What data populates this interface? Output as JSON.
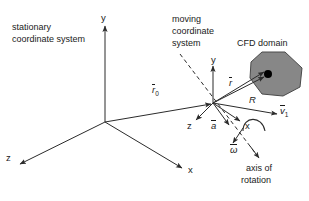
{
  "figure": {
    "background": "#ffffff",
    "stroke_color": "#2b2b2b",
    "domain_fill": "#878787",
    "domain_stroke": "#4a4a4a",
    "point_color": "#000000",
    "width": 309,
    "height": 201
  },
  "captions": {
    "stationary_line1": "stationary",
    "stationary_line2": "coordinate system",
    "moving_line1": "moving",
    "moving_line2": "coordinate",
    "moving_line3": "system",
    "cfd_domain": "CFD domain",
    "axis_of_rotation_line1": "axis of",
    "axis_of_rotation_line2": "rotation"
  },
  "stationary_frame": {
    "origin": [
      105,
      122
    ],
    "axes": [
      {
        "name": "y-axis",
        "label": "y",
        "label_pos": [
          101,
          14
        ],
        "tip": [
          105,
          26
        ]
      },
      {
        "name": "x-axis",
        "label": "x",
        "label_pos": [
          188,
          166
        ],
        "tip": [
          182,
          168
        ]
      },
      {
        "name": "z-axis",
        "label": "z",
        "label_pos": [
          7,
          156
        ],
        "tip": [
          20,
          164
        ]
      }
    ]
  },
  "moving_frame": {
    "origin": [
      213,
      103
    ],
    "axes": [
      {
        "name": "y-axis",
        "label": "y",
        "label_pos": [
          211,
          55
        ],
        "tip": [
          213,
          66
        ]
      },
      {
        "name": "x-axis",
        "label": "x",
        "label_pos": [
          246,
          123
        ],
        "tip": [
          240,
          121
        ]
      },
      {
        "name": "z-axis",
        "label": "z",
        "label_pos": [
          188,
          123
        ],
        "tip": [
          196,
          120
        ]
      }
    ]
  },
  "vectors": [
    {
      "name": "r0-vector",
      "label": "r",
      "subscript": "0",
      "label_pos": [
        152,
        85
      ],
      "from": [
        105,
        122
      ],
      "to": [
        213,
        103
      ]
    },
    {
      "name": "r-vector",
      "label": "r",
      "subscript": "",
      "label_pos": [
        229,
        78
      ],
      "from": [
        213,
        103
      ],
      "to": [
        265,
        73
      ]
    },
    {
      "name": "R-vector",
      "label": "R",
      "subscript": "",
      "label_pos": [
        249,
        95
      ],
      "overbar": false,
      "from": [
        213,
        103
      ],
      "to": [
        266,
        76
      ]
    },
    {
      "name": "a-vector",
      "label": "a",
      "subscript": "",
      "label_pos": [
        212,
        121
      ],
      "from": [
        213,
        103
      ],
      "to": [
        229,
        125
      ]
    },
    {
      "name": "v1-vector",
      "label": "v",
      "subscript": "1",
      "label_pos": [
        281,
        106
      ],
      "from": [
        213,
        103
      ],
      "to": [
        277,
        114
      ]
    },
    {
      "name": "omega-vector",
      "label": "ω",
      "subscript": "",
      "label_pos": [
        232,
        147
      ],
      "from": [
        243,
        130
      ],
      "to": [
        233,
        143
      ]
    }
  ],
  "rotation_axis": {
    "name": "axis-of-rotation-line",
    "from": [
      180,
      54
    ],
    "to": [
      259,
      158
    ],
    "style": "dashed",
    "label_pos": [
      248,
      163
    ]
  },
  "cfd_domain_shape": {
    "name": "cfd-domain-polygon",
    "points": "262,52 285,52 302,68 300,87 283,96 262,94 250,78 251,62",
    "marker_point": [
      268,
      74
    ],
    "marker_radius": 4
  }
}
